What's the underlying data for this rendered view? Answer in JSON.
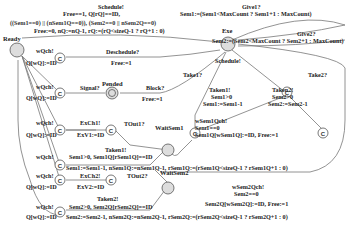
{
  "locations": {
    "ready": "Ready",
    "exe": "Exe",
    "pended": "Pended",
    "wait_sem1": "WaitSem1",
    "wait_sem2": "WaitSem2",
    "committed": "C"
  },
  "edges": {
    "schedule_top": [
      "Schedule!",
      "Free==1, Q[rQ]==ID,",
      "((Sem1==0) || (nSem1Q==0)), (Sem2==0 || nSem2Q==0)",
      "Free:=0, nQ:=nQ-1, rQ:=(rQ<sizeQ-1 ? rQ+1 : 0)"
    ],
    "give1": [
      "Give1?",
      "Sem1:=(Sem1<MaxCount ? Sem1+1 : MaxCount)"
    ],
    "give2": [
      "Give2?",
      "Sem2:=(Sem2<MaxCount ? Sem2+1 : MaxCount)"
    ],
    "deschedule": [
      "Deschedule?",
      "Free:=1"
    ],
    "wqch_1": [
      "wQch!",
      "Q[wQ]:=ID"
    ],
    "signal": "Signal?",
    "block": [
      "Block?",
      "Free:=1"
    ],
    "wqch_2": [
      "wQch!",
      "Q[wQ]:=ID"
    ],
    "wqch_3": [
      "wQch!",
      "Q[wQ]:=ID"
    ],
    "exch1": [
      "ExCh1!",
      "ExV1:=ID"
    ],
    "tout1": "TOut1?",
    "taken1": [
      "Taken1!",
      "Sem1>0, Sem1Q[rSem1Q]==ID",
      "Sem1:=Sem1-1, nSem1Q:=nSem1Q-1, rSem1Q:=(rSem1Q<sizeQ-1 ? rSem1Q+1 : 0)"
    ],
    "wqch_4": [
      "wQch!",
      "Q[wQ]:=ID"
    ],
    "exch2": [
      "ExCh2!",
      "ExV2:=ID"
    ],
    "tout2": "TOut2?",
    "taken2": [
      "Taken2!",
      "Sem2>0, Sem2Q[rSem2Q]==ID",
      "Sem2:=Sem2-1, nSem2Q:=nSem2Q-1, rSem2Q:=(rSem2Q<sizeQ-1 ? rSem2Q+1 : 0)"
    ],
    "schedule_mid": "Schedule!",
    "take1": "Take1?",
    "take2": "Take2?",
    "taken1_r": [
      "Taken1!",
      "Sem1>0",
      "Sem1:=Sem1-1"
    ],
    "taken2_r": [
      "Taken2!",
      "Sem2>0",
      "Sem2:=Sem2-1"
    ],
    "wsem1": [
      "wSem1Qch!",
      "Sem1==0",
      "Sem1Q[wSem1Q]:=ID, Free:=1"
    ],
    "wsem2": [
      "wSem2Qch!",
      "Sem2==0",
      "Sem2Q[wSem2Q]:=ID, Free:=1"
    ]
  }
}
